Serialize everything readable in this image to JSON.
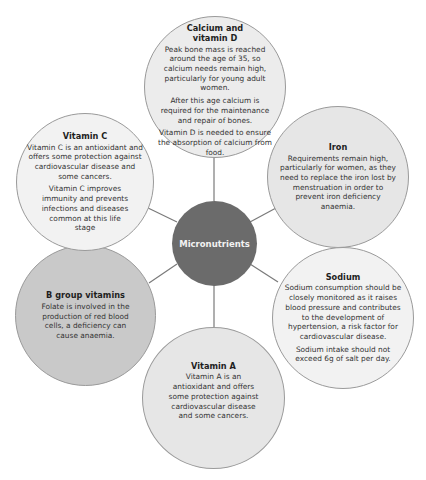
{
  "diagram": {
    "center": {
      "label": "Micronutrients",
      "color": "#6b6b6b"
    },
    "nodes": [
      {
        "id": "calcium",
        "title": "Calcium and vitamin D",
        "paragraphs": [
          "Peak bone mass is reached around the age of 35, so calcium needs remain high, particularly for young adult women.",
          "After this age calcium is required for the maintenance and repair of bones.",
          "Vitamin D is needed to ensure the absorption of calcium from food."
        ],
        "fill": "#ececec"
      },
      {
        "id": "iron",
        "title": "Iron",
        "paragraphs": [
          "Requirements remain high, particularly for women, as they need to replace the iron lost by menstruation in order to prevent iron deficiency anaemia."
        ],
        "fill": "#e6e6e6"
      },
      {
        "id": "sodium",
        "title": "Sodium",
        "paragraphs": [
          "Sodium consumption should be closely monitored as it raises blood pressure and contributes to the development of hypertension, a risk factor for cardiovascular disease.",
          "Sodium intake should not exceed 6g of salt per day."
        ],
        "fill": "#f2f2f2"
      },
      {
        "id": "vitamin-a",
        "title": "Vitamin A",
        "paragraphs": [
          "Vitamin A is an antioxidant and offers some protection against cardiovascular disease and some cancers."
        ],
        "fill": "#e6e6e6"
      },
      {
        "id": "b-group",
        "title": "B group vitamins",
        "paragraphs": [
          "Folate is involved in the production of red blood cells, a deficiency can cause anaemia."
        ],
        "fill": "#c9c9c9"
      },
      {
        "id": "vitamin-c",
        "title": "Vitamin C",
        "paragraphs": [
          "Vitamin C is an antioxidant and offers some protection against cardiovascular disease and some cancers.",
          "Vitamin C improves immunity and prevents infections and diseases common at this life stage"
        ],
        "fill": "#f2f2f2"
      }
    ]
  }
}
